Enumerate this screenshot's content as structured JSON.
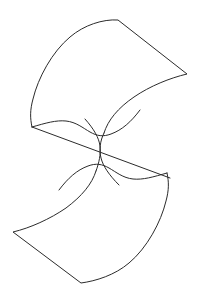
{
  "document": {
    "title": "Saddle Surface Line Drawing",
    "kind": "line-drawing",
    "subject": "hyperbolic-paraboloid-saddle-surface",
    "width": 199,
    "height": 300
  },
  "canvas": {
    "background_color": "#ffffff",
    "view_box": "0 0 199 300"
  },
  "style": {
    "stroke_color": "#2b2b2b",
    "stroke_width": 1,
    "fill": "none",
    "line_cap": "round",
    "line_join": "round"
  },
  "chart_data": {
    "type": "line",
    "xlabel": "",
    "ylabel": "",
    "xlim": [
      0,
      199
    ],
    "ylim": [
      0,
      300
    ],
    "grid": false,
    "legend": "none",
    "annotations": [],
    "key_points": {
      "top_corner": [
        118,
        20
      ],
      "right_vertex": [
        187,
        74
      ],
      "upper_left_extreme": [
        31,
        105
      ],
      "left_junction": [
        32,
        127
      ],
      "right_junction": [
        167,
        173
      ],
      "bottom_left_vertex": [
        13,
        232
      ],
      "bottom_corner": [
        82,
        283
      ],
      "lower_right_extreme": [
        168,
        195
      ],
      "saddle_crossing_upper": [
        104,
        133
      ],
      "saddle_crossing_lower": [
        107,
        160
      ]
    },
    "series": [
      {
        "name": "upper-patch-outline",
        "path": "M 32 127 C 30 118 30 110 33 99 C 38 78 52 52 70 37 C 84 25 103 19 118 20 L 187 74 C 170 78 150 86 134 97 C 118 108 108 120 104 133"
      },
      {
        "name": "lower-patch-outline",
        "path": "M 167 173 C 169 182 169 190 166 201 C 161 222 147 248 129 263 C 115 275 96 281 81 283 L 13 232 C 30 228 50 219 66 208 C 82 196 92 184 96 171"
      },
      {
        "name": "median-straight-line",
        "path": "M 32 127 L 170 178"
      },
      {
        "name": "upper-saddle-curve",
        "path": "M 32 127 C 46 123 56 120 66 121 C 76 122 83 128 90 132 C 97 136 103 137 111 134 C 122 130 131 122 140 110"
      },
      {
        "name": "lower-saddle-curve",
        "path": "M 167 173 C 153 177 143 180 133 179 C 123 178 116 172 109 168 C 102 164 96 163 88 166 C 77 170 68 178 59 190"
      },
      {
        "name": "saddle-lens-left-edge",
        "path": "M 104 133 C 100 141 99 150 101 158 C 103 166 109 175 119 185"
      },
      {
        "name": "saddle-lens-right-edge",
        "path": "M 96 171 C 99 163 101 154 100 146 C 99 138 94 129 85 119"
      }
    ]
  },
  "elements": {
    "upper_patch_label": "upper surface patch",
    "lower_patch_label": "lower surface patch",
    "median_line_label": "central straight ruling line",
    "upper_saddle_label": "upper saddle fold curve",
    "lower_saddle_label": "lower saddle fold curve",
    "lens_left_label": "saddle waist left edge",
    "lens_right_label": "saddle waist right edge"
  }
}
